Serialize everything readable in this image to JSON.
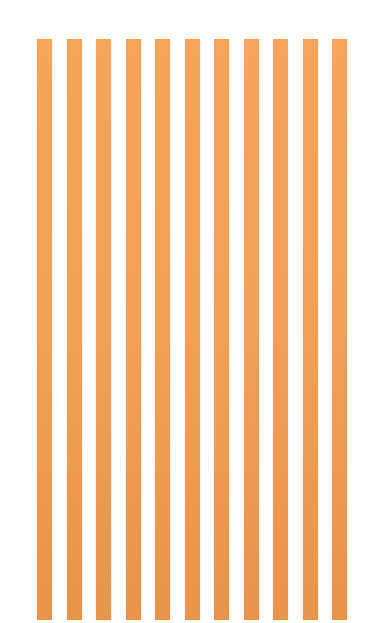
{
  "image": {
    "description": "Vertical orange stripes on a white background",
    "stripe_count": 11,
    "colors": {
      "stripe_top": "#f6a45c",
      "stripe_mid": "#f29f58",
      "stripe_bottom": "#e9944c",
      "background": "#fefefe"
    },
    "stripes": [
      {
        "x": 37
      },
      {
        "x": 67
      },
      {
        "x": 96
      },
      {
        "x": 126
      },
      {
        "x": 155
      },
      {
        "x": 185
      },
      {
        "x": 214
      },
      {
        "x": 244
      },
      {
        "x": 273
      },
      {
        "x": 303
      },
      {
        "x": 332
      }
    ]
  }
}
